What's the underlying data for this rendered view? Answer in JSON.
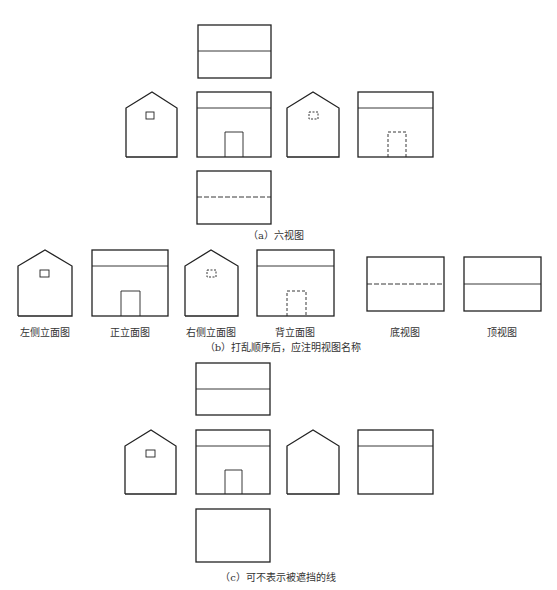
{
  "section_a": {
    "caption": "（a）六视图",
    "views": [
      "top-view",
      "left-elevation",
      "front-elevation",
      "right-elevation",
      "back-elevation",
      "bottom-view"
    ]
  },
  "section_b": {
    "caption": "（b）打乱顺序后，应注明视图名称",
    "labels": [
      "左侧立面图",
      "正立面图",
      "右侧立面图",
      "背立面图",
      "底视图",
      "顶视图"
    ]
  },
  "section_c": {
    "caption": "（c）可不表示被遮挡的线",
    "views": [
      "top-view",
      "left-elevation",
      "front-elevation",
      "right-elevation",
      "back-elevation",
      "bottom-view"
    ]
  },
  "colors": {
    "line": "#222222",
    "text": "#333333"
  }
}
